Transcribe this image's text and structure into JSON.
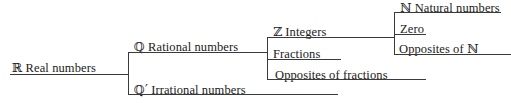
{
  "diagram": {
    "line_color": "#3a3a3a",
    "text_color": "#1a1a1a",
    "background": "#ffffff",
    "nodes": {
      "real": {
        "symbol": "ℝ",
        "label": "Real numbers"
      },
      "rational": {
        "symbol": "ℚ",
        "label": "Rational numbers"
      },
      "irrational": {
        "symbol": "ℚ′",
        "label": "Irrational numbers"
      },
      "integers": {
        "symbol": "ℤ",
        "label": "Integers"
      },
      "fractions": {
        "symbol": "",
        "label": "Fractions"
      },
      "opposites_fractions": {
        "symbol": "",
        "label": "Opposites of fractions"
      },
      "natural": {
        "symbol": "ℕ",
        "label": "Natural numbers"
      },
      "zero": {
        "symbol": "",
        "label": "Zero"
      },
      "opposites_natural": {
        "symbol": "",
        "label": "Opposites of ℕ"
      }
    }
  }
}
